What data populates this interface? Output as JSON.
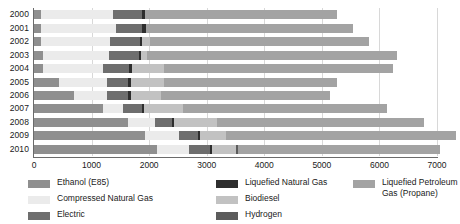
{
  "chart_data": {
    "type": "bar",
    "orientation": "horizontal",
    "stacked": true,
    "title": "",
    "xlabel": "",
    "ylabel": "",
    "xlim": [
      0,
      7000
    ],
    "grid": true,
    "legend_position": "bottom",
    "xticks": [
      0,
      1000,
      2000,
      3000,
      4000,
      5000,
      6000,
      7000
    ],
    "xtick_labels": [
      "0",
      "1000",
      "2000",
      "3000",
      "4000",
      "5000",
      "6000",
      "7000"
    ],
    "categories": [
      "2000",
      "2001",
      "2002",
      "2003",
      "2004",
      "2005",
      "2006",
      "2007",
      "2008",
      "2009",
      "2010"
    ],
    "series": [
      {
        "name": "Ethanol (E85)",
        "color": "#8f8f8f",
        "values": [
          120,
          120,
          130,
          150,
          160,
          430,
          700,
          1190,
          1640,
          1930,
          2130
        ]
      },
      {
        "name": "Compressed Natural Gas",
        "color": "#ebebeb",
        "values": [
          1250,
          1300,
          1190,
          1150,
          1040,
          840,
          560,
          360,
          460,
          580,
          560
        ]
      },
      {
        "name": "Electric",
        "color": "#6e6e6e",
        "values": [
          510,
          460,
          520,
          520,
          450,
          370,
          380,
          320,
          300,
          340,
          360
        ]
      },
      {
        "name": "Liquefied Natural Gas",
        "color": "#2e2e2e",
        "values": [
          55,
          60,
          40,
          40,
          60,
          50,
          40,
          40,
          40,
          40,
          40
        ]
      },
      {
        "name": "Biodiesel",
        "color": "#c2c2c2",
        "values": [
          0,
          0,
          130,
          100,
          540,
          560,
          530,
          670,
          740,
          450,
          420
        ]
      },
      {
        "name": "Hydrogen",
        "color": "#5c5c5c",
        "values": [
          0,
          0,
          0,
          0,
          0,
          0,
          0,
          0,
          0,
          0,
          40
        ]
      },
      {
        "name": "Liquefied Petroleum Gas (Propane)",
        "color": "#a3a3a3",
        "values": [
          3320,
          3600,
          3810,
          4350,
          3980,
          3010,
          2930,
          3560,
          3590,
          3990,
          3500
        ]
      }
    ],
    "totals": [
      5255,
      5540,
      5820,
      6310,
      6230,
      5260,
      5140,
      6140,
      6770,
      7330,
      7050
    ],
    "legend_entries": [
      "Ethanol (E85)",
      "Compressed Natural Gas",
      "Electric",
      "Liquefied Natural Gas",
      "Biodiesel",
      "Hydrogen",
      "Liquefied Petroleum Gas (Propane)"
    ]
  },
  "legend": {
    "col1": [
      "Ethanol (E85)",
      "Compressed Natural Gas",
      "Electric"
    ],
    "col2": [
      "Liquefied Natural Gas",
      "Biodiesel",
      "Hydrogen"
    ],
    "col3_line1": "Liquefied Petroleum",
    "col3_line2": "Gas (Propane)"
  }
}
